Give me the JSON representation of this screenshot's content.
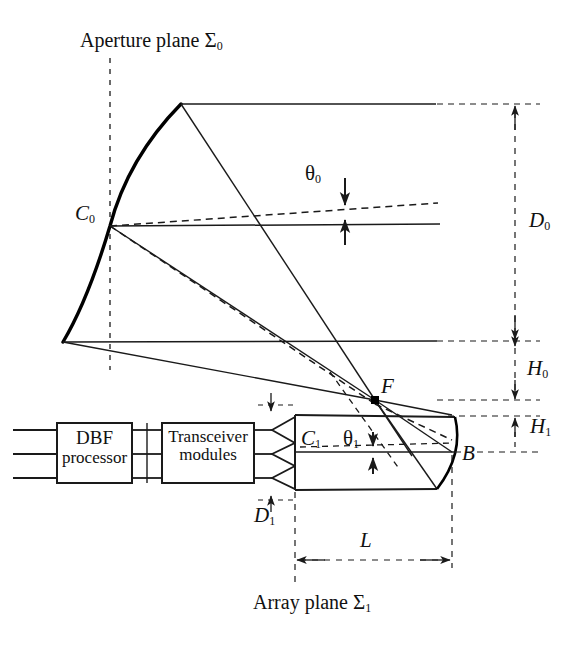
{
  "figure": {
    "type": "optical-antenna-ray-diagram",
    "title_labels": {
      "aperture_plane": "Aperture plane",
      "aperture_plane_symbol": "Σ",
      "aperture_plane_sub": "0",
      "array_plane": "Array plane",
      "array_plane_symbol": "Σ",
      "array_plane_sub": "1"
    },
    "blocks": [
      {
        "id": "dbf",
        "line1": "DBF",
        "line2": "processor"
      },
      {
        "id": "transceiver",
        "line1": "Transceiver",
        "line2": "modules"
      }
    ],
    "point_labels": [
      {
        "id": "C0",
        "base": "C",
        "sub": "0",
        "italic": true
      },
      {
        "id": "C1",
        "base": "C",
        "sub": "1",
        "italic": true
      },
      {
        "id": "F",
        "base": "F",
        "sub": "",
        "italic": true
      },
      {
        "id": "B",
        "base": "B",
        "sub": "",
        "italic": true
      }
    ],
    "angle_labels": [
      {
        "id": "theta0",
        "base": "θ",
        "sub": "0",
        "italic": false
      },
      {
        "id": "theta1",
        "base": "θ",
        "sub": "1",
        "italic": false
      }
    ],
    "dimension_labels": [
      {
        "id": "D0",
        "base": "D",
        "sub": "0",
        "italic": true
      },
      {
        "id": "D1",
        "base": "D",
        "sub": "1",
        "italic": true
      },
      {
        "id": "H0",
        "base": "H",
        "sub": "0",
        "italic": true
      },
      {
        "id": "H1",
        "base": "H",
        "sub": "1",
        "italic": true
      },
      {
        "id": "L",
        "base": "L",
        "sub": "",
        "italic": true
      }
    ],
    "colors": {
      "stroke": "#1a1a1a",
      "background": "#ffffff",
      "reflector": "#000000"
    },
    "geometry": {
      "reflector_top_vertex": [
        181,
        104
      ],
      "reflector_C0": [
        110,
        226
      ],
      "reflector_bottom_vertex": [
        63,
        342
      ],
      "focus_F": [
        375,
        400
      ],
      "array_left_x": 295,
      "array_top_y": 415,
      "array_bottom_y": 490,
      "array_right_x": 452,
      "dimension_line_x": 515,
      "D0_top_y": 104,
      "D0_bottom_y": 342,
      "H0_bottom_y": 400,
      "H1_bottom_y": 440,
      "L_y": 545
    }
  }
}
